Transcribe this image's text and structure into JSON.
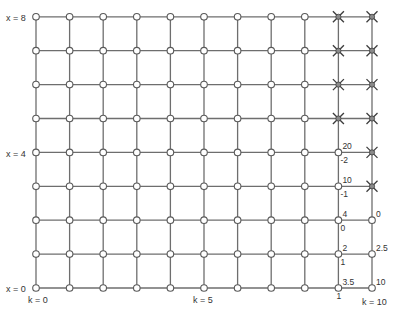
{
  "diagram": {
    "grid": {
      "k_min": 0,
      "k_max": 10,
      "x_min": 0,
      "x_max": 8,
      "origin_px": [
        36,
        288
      ],
      "step_px": [
        33.6,
        33.9
      ]
    },
    "axis_labels": {
      "x8": "x = 8",
      "x4": "x = 4",
      "x0": "x = 0",
      "k0": "k = 0",
      "k5": "k = 5",
      "k10": "k = 10"
    },
    "crossed_nodes": [
      {
        "k": 9,
        "x": 8
      },
      {
        "k": 9,
        "x": 7
      },
      {
        "k": 9,
        "x": 6
      },
      {
        "k": 9,
        "x": 5
      },
      {
        "k": 10,
        "x": 8
      },
      {
        "k": 10,
        "x": 7
      },
      {
        "k": 10,
        "x": 6
      },
      {
        "k": 10,
        "x": 5
      },
      {
        "k": 10,
        "x": 4
      },
      {
        "k": 10,
        "x": 3
      }
    ],
    "node_values": [
      {
        "k": 9,
        "x": 4,
        "above": "20",
        "below": "-2"
      },
      {
        "k": 9,
        "x": 3,
        "above": "10",
        "below": "-1"
      },
      {
        "k": 9,
        "x": 2,
        "above": "4",
        "below": "0"
      },
      {
        "k": 9,
        "x": 1,
        "above": "2",
        "below": "1"
      },
      {
        "k": 9,
        "x": 0,
        "above": "3.5",
        "below": "1"
      },
      {
        "k": 10,
        "x": 2,
        "above": "0",
        "below": ""
      },
      {
        "k": 10,
        "x": 1,
        "above": "2.5",
        "below": ""
      },
      {
        "k": 10,
        "x": 0,
        "above": "10",
        "below": ""
      }
    ],
    "colors": {
      "line": "#6e6e6e",
      "node_fill": "#ffffff",
      "cross": "#3c3c3c",
      "text": "#333333"
    }
  }
}
